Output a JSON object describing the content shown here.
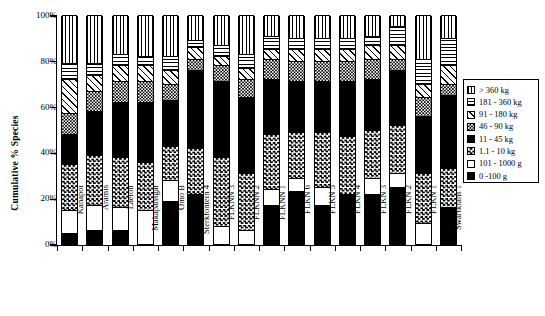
{
  "chart_data": {
    "type": "bar",
    "title": "",
    "xlabel": "",
    "ylabel": "Cumulative % Species",
    "ylim": [
      0,
      100
    ],
    "ytick_labels": [
      "0%",
      "20%",
      "40%",
      "60%",
      "80%",
      "100%"
    ],
    "ytick_values": [
      0,
      20,
      40,
      60,
      80,
      100
    ],
    "grid": false,
    "stacked": true,
    "legend_position": "right",
    "categories": [
      "Kanapoi",
      "Aramis",
      "Laetoli",
      "Makapansgat",
      "Omo B",
      "Sterkfontein 4",
      "FLKNN 3",
      "FLKNN 2",
      "FLKNN 1",
      "FLKN 6",
      "FLKN 5",
      "FLKN 4",
      "FLKN 3",
      "FLKN 2",
      "FLKN 1",
      "Swartkrans 1"
    ],
    "series": [
      {
        "name": "0 -100 g",
        "pattern": "solid-black",
        "values": [
          5,
          6,
          6,
          0,
          19,
          22,
          0,
          0,
          17,
          23,
          17,
          22,
          22,
          25,
          0,
          16
        ]
      },
      {
        "name": "101 - 1000 g",
        "pattern": "white",
        "values": [
          10,
          11,
          10,
          15,
          9,
          0,
          8,
          6,
          7,
          6,
          8,
          0,
          7,
          6,
          9,
          0
        ]
      },
      {
        "name": "1.1 - 10 kg",
        "pattern": "checkerboard",
        "values": [
          20,
          22,
          22,
          21,
          15,
          20,
          30,
          25,
          24,
          20,
          24,
          25,
          21,
          21,
          22,
          17
        ]
      },
      {
        "name": "11 - 45 kg",
        "pattern": "solid-black",
        "values": [
          13,
          19,
          24,
          26,
          20,
          34,
          33,
          33,
          24,
          22,
          22,
          24,
          22,
          24,
          25,
          32
        ]
      },
      {
        "name": "46 - 90 kg",
        "pattern": "gray-checker",
        "values": [
          9,
          9,
          9,
          9,
          7,
          5,
          7,
          8,
          9,
          9,
          9,
          9,
          9,
          5,
          8,
          5
        ]
      },
      {
        "name": "91 - 180 kg",
        "pattern": "diagonal-hatch",
        "values": [
          15,
          7,
          7,
          7,
          6,
          5,
          4,
          5,
          4,
          5,
          5,
          5,
          6,
          6,
          6,
          8
        ]
      },
      {
        "name": "181 - 360 kg",
        "pattern": "horizontal-lines",
        "values": [
          7,
          5,
          5,
          4,
          6,
          3,
          5,
          6,
          6,
          5,
          5,
          5,
          4,
          8,
          11,
          12
        ]
      },
      {
        "name": "> 360 kg",
        "pattern": "vertical-lines",
        "values": [
          21,
          21,
          17,
          18,
          18,
          11,
          13,
          17,
          9,
          10,
          10,
          10,
          9,
          5,
          19,
          10
        ]
      }
    ]
  },
  "legend": {
    "entries": [
      {
        "label": "> 360 kg",
        "pattern": "vertical-lines"
      },
      {
        "label": "181 - 360 kg",
        "pattern": "horizontal-lines"
      },
      {
        "label": "91 - 180 kg",
        "pattern": "diagonal-hatch"
      },
      {
        "label": "46 - 90 kg",
        "pattern": "gray-checker"
      },
      {
        "label": "11 - 45 kg",
        "pattern": "solid-black"
      },
      {
        "label": "1.1 - 10 kg",
        "pattern": "checkerboard"
      },
      {
        "label": "101 - 1000 g",
        "pattern": "white"
      },
      {
        "label": "0 -100 g",
        "pattern": "solid-black"
      }
    ]
  },
  "colors": {
    "ink": "#000000",
    "paper": "#ffffff",
    "gray": "#8d8d8d"
  }
}
